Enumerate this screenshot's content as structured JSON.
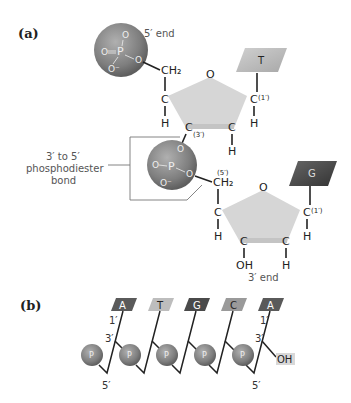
{
  "panels": {
    "a": {
      "label": "(a)",
      "five_end": "5′ end",
      "three_end": "3′ end",
      "bond_caption": [
        "3′ to 5′",
        "phosphodiester",
        "bond"
      ],
      "phosphate": {
        "P": "P",
        "O": "O",
        "O_minus": "O⁻"
      },
      "ch2": "CH₂",
      "C": "C",
      "H": "H",
      "O": "O",
      "OH": "OH",
      "pos_1": "(1′)",
      "pos_3": "(3′)",
      "pos_5": "(5′)",
      "bases": [
        {
          "letter": "T",
          "color": "#b9b9b9"
        },
        {
          "letter": "G",
          "color": "#4a4a4a"
        }
      ]
    },
    "b": {
      "label": "(b)",
      "phosphate_label": "P",
      "prime_1": "1′",
      "prime_3": "3′",
      "prime_5": "5′",
      "oh": "OH",
      "bases": [
        {
          "letter": "A",
          "color": "#5a5a5a",
          "text": "#ffffff"
        },
        {
          "letter": "T",
          "color": "#bdbdbd",
          "text": "#222222"
        },
        {
          "letter": "G",
          "color": "#4a4a4a",
          "text": "#ffffff"
        },
        {
          "letter": "C",
          "color": "#9a9a9a",
          "text": "#222222"
        },
        {
          "letter": "A",
          "color": "#5a5a5a",
          "text": "#ffffff"
        }
      ]
    }
  },
  "colors": {
    "sugar": "#d6d6d6",
    "phosphate_sphere": "#8a8a8a",
    "bracket": "#777777"
  }
}
